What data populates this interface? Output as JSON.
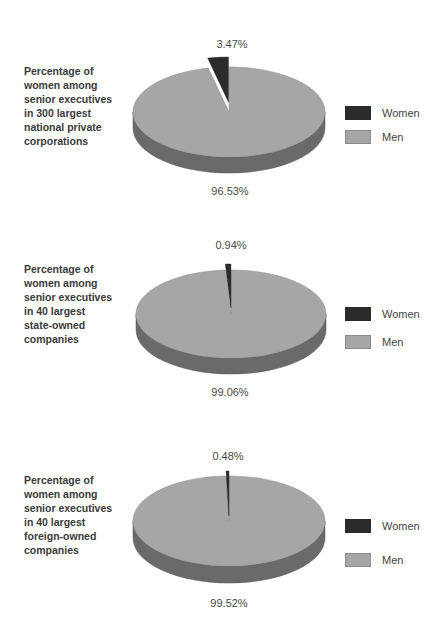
{
  "colors": {
    "women": "#2b2b2b",
    "women_side": "#1e1e1e",
    "men": "#a6a6a6",
    "men_side": "#6a6a6a",
    "text": "#3a3a3a"
  },
  "legend": {
    "women_label": "Women",
    "men_label": "Men"
  },
  "charts": [
    {
      "description": [
        "Percentage of",
        "women among",
        "senior executives",
        "in 300 largest",
        "national private",
        "corporations"
      ],
      "women_pct_label": "3.47%",
      "men_pct_label": "96.53%"
    },
    {
      "description": [
        "Percentage of",
        "women among",
        "senior executives",
        "in 40 largest",
        "state-owned",
        "companies"
      ],
      "women_pct_label": "0.94%",
      "men_pct_label": "99.06%"
    },
    {
      "description": [
        "Percentage of",
        "women among",
        "senior executives",
        "in 40 largest",
        "foreign-owned",
        "companies"
      ],
      "women_pct_label": "0.48%",
      "men_pct_label": "99.52%"
    }
  ],
  "chart_data": [
    {
      "type": "pie",
      "title": "Percentage of women among senior executives in 300 largest national private corporations",
      "categories": [
        "Women",
        "Men"
      ],
      "values": [
        3.47,
        96.53
      ],
      "legend_position": "right"
    },
    {
      "type": "pie",
      "title": "Percentage of women among senior executives in 40 largest state-owned companies",
      "categories": [
        "Women",
        "Men"
      ],
      "values": [
        0.94,
        99.06
      ],
      "legend_position": "right"
    },
    {
      "type": "pie",
      "title": "Percentage of women among senior executives in 40 largest foreign-owned companies",
      "categories": [
        "Women",
        "Men"
      ],
      "values": [
        0.48,
        99.52
      ],
      "legend_position": "right"
    }
  ]
}
